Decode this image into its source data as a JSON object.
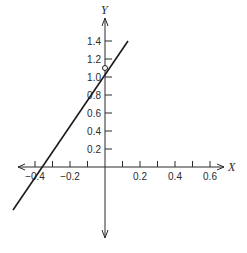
{
  "figure": {
    "x_axis_label": "X",
    "y_axis_label": "Y",
    "x_ticks": [
      {
        "value": -0.4,
        "label": "−0.4",
        "px": 35
      },
      {
        "value": -0.3,
        "label": "",
        "px": 52.5
      },
      {
        "value": -0.2,
        "label": "−0.2",
        "px": 70
      },
      {
        "value": -0.1,
        "label": "",
        "px": 87.5
      },
      {
        "value": 0.1,
        "label": "",
        "px": 122.5
      },
      {
        "value": 0.2,
        "label": "0.2",
        "px": 140
      },
      {
        "value": 0.3,
        "label": "",
        "px": 157.5
      },
      {
        "value": 0.4,
        "label": "0.4",
        "px": 175
      },
      {
        "value": 0.5,
        "label": "",
        "px": 192.5
      },
      {
        "value": 0.6,
        "label": "0.6",
        "px": 210
      }
    ],
    "y_ticks": [
      {
        "value": 0.2,
        "label": "0.2",
        "px": 149
      },
      {
        "value": 0.4,
        "label": "0.4",
        "px": 131
      },
      {
        "value": 0.6,
        "label": "0.6",
        "px": 113
      },
      {
        "value": 0.8,
        "label": "0.8",
        "px": 95
      },
      {
        "value": 1.0,
        "label": "1.0",
        "px": 77
      },
      {
        "value": 1.2,
        "label": "1.2",
        "px": 59
      },
      {
        "value": 1.4,
        "label": "1.4",
        "px": 41
      }
    ],
    "line": {
      "slope": 2.5,
      "intercept": 1.1,
      "color": "#1a1a1a"
    },
    "open_point": {
      "x": 0,
      "y": 1.1
    }
  },
  "chart_data": {
    "type": "line",
    "title": "",
    "xlabel": "X",
    "ylabel": "Y",
    "xlim": [
      -0.45,
      0.65
    ],
    "ylim": [
      -0.5,
      1.5
    ],
    "x_tick_labels": [
      "-0.4",
      "-0.2",
      "0.2",
      "0.4",
      "0.6"
    ],
    "y_tick_labels": [
      "0.2",
      "0.4",
      "0.6",
      "0.8",
      "1.0",
      "1.2",
      "1.4"
    ],
    "series": [
      {
        "name": "line",
        "x": [
          -0.52,
          0.13
        ],
        "y": [
          -0.2,
          1.42
        ]
      }
    ],
    "annotations": [
      {
        "type": "open-circle",
        "x": 0,
        "y": 1.1,
        "note": "y-intercept excluded"
      }
    ],
    "grid": false,
    "legend": null
  }
}
